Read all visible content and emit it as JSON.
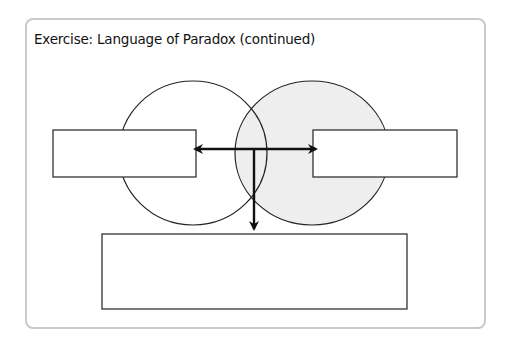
{
  "title": "Exercise: Language of Paradox (continued)",
  "colors": {
    "frame_border": "#c9c9c9",
    "stroke": "#222222",
    "right_circle_fill": "#eeeeee",
    "left_circle_fill": "#ffffff",
    "box_fill": "#ffffff"
  },
  "diagram": {
    "circles": [
      {
        "id": "left-circle",
        "filled": false
      },
      {
        "id": "right-circle",
        "filled": true
      }
    ],
    "boxes": [
      {
        "id": "left-answer-box",
        "text": ""
      },
      {
        "id": "right-answer-box",
        "text": ""
      },
      {
        "id": "bottom-answer-box",
        "text": ""
      }
    ],
    "arrows": [
      {
        "id": "arrow-left",
        "direction": "left"
      },
      {
        "id": "arrow-right",
        "direction": "right"
      },
      {
        "id": "arrow-down",
        "direction": "down"
      }
    ]
  }
}
